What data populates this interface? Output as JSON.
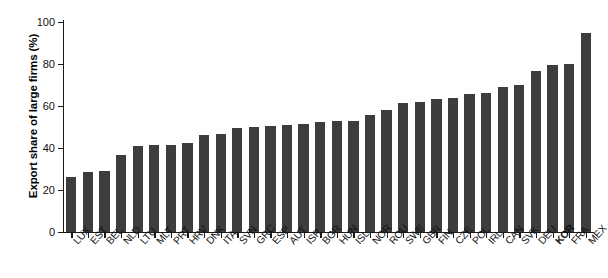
{
  "chart_data": {
    "type": "bar",
    "title": "",
    "xlabel": "",
    "ylabel": "Export share of large firms (%)",
    "ylim": [
      0,
      100
    ],
    "yticks": [
      0,
      20,
      40,
      60,
      80,
      100
    ],
    "ytick_labels": [
      "0",
      "20",
      "40",
      "60",
      "80",
      "100"
    ],
    "grid": false,
    "legend": null,
    "highlighted_category": "KOR",
    "bar_color": "#3d3d3d",
    "categories": [
      "LUX",
      "EST",
      "BEL",
      "NLD",
      "LTU",
      "MLT",
      "PRT",
      "HRV",
      "DNK",
      "ITA",
      "SVN",
      "GRC",
      "ESP",
      "AUT",
      "ISR",
      "BGR",
      "HUN",
      "ISL",
      "NOR",
      "ROU",
      "SWE",
      "GBR",
      "FIN",
      "CZE",
      "POL",
      "IRL",
      "CAN",
      "SVK",
      "DEU",
      "KOR",
      "FRA",
      "MEX"
    ],
    "values": [
      26,
      28.5,
      29,
      36.5,
      41,
      41.5,
      41.5,
      42.5,
      46,
      46.5,
      49.5,
      50,
      50.5,
      51,
      51.5,
      52.5,
      53,
      53,
      55.5,
      58,
      61.5,
      62,
      63.5,
      64,
      65.5,
      66,
      69,
      70,
      76.5,
      79.5,
      80,
      95
    ],
    "series": [
      {
        "name": "Export share of large firms",
        "values": [
          26,
          28.5,
          29,
          36.5,
          41,
          41.5,
          41.5,
          42.5,
          46,
          46.5,
          49.5,
          50,
          50.5,
          51,
          51.5,
          52.5,
          53,
          53,
          55.5,
          58,
          61.5,
          62,
          63.5,
          64,
          65.5,
          66,
          69,
          70,
          76.5,
          79.5,
          80,
          95
        ]
      }
    ]
  }
}
